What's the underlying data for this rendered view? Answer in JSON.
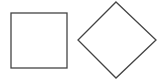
{
  "canvas": {
    "width": 163,
    "height": 80,
    "background": "#ffffff"
  },
  "shapes": [
    {
      "type": "square",
      "x": 11,
      "y": 13,
      "width": 56,
      "height": 55,
      "stroke": "#444444",
      "fill": "#ffffff"
    },
    {
      "type": "diamond",
      "points": "116,2 156,40 116,78 78,40",
      "stroke": "#444444",
      "fill": "#ffffff"
    }
  ]
}
